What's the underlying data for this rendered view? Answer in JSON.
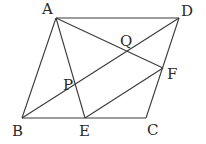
{
  "diagram": {
    "type": "geometry-figure",
    "colors": {
      "line": "#3a3a3a",
      "label": "#2a2a2a",
      "background": "#ffffff"
    },
    "points": {
      "A": {
        "label": "A",
        "x": 56,
        "y": 18,
        "label_x": 42,
        "label_y": 14
      },
      "D": {
        "label": "D",
        "x": 179,
        "y": 18,
        "label_x": 181,
        "label_y": 16
      },
      "B": {
        "label": "B",
        "x": 22,
        "y": 118,
        "label_x": 12,
        "label_y": 136
      },
      "C": {
        "label": "C",
        "x": 146,
        "y": 118,
        "label_x": 147,
        "label_y": 135
      },
      "E": {
        "label": "E",
        "x": 85,
        "y": 118,
        "label_x": 79,
        "label_y": 136
      },
      "F": {
        "label": "F",
        "x": 163,
        "y": 68,
        "label_x": 167,
        "label_y": 79
      },
      "P": {
        "label": "P",
        "x": 74,
        "y": 92,
        "label_x": 63,
        "label_y": 90
      },
      "Q": {
        "label": "Q",
        "x": 127,
        "y": 48,
        "label_x": 120,
        "label_y": 46
      }
    },
    "segments": [
      {
        "name": "AB",
        "from": "A",
        "to": "B"
      },
      {
        "name": "AD",
        "from": "A",
        "to": "D"
      },
      {
        "name": "DC",
        "from": "D",
        "to": "C"
      },
      {
        "name": "BC",
        "from": "B",
        "to": "C"
      },
      {
        "name": "BD",
        "from": "B",
        "to": "D"
      },
      {
        "name": "AE",
        "from": "A",
        "to": "E"
      },
      {
        "name": "AF",
        "from": "A",
        "to": "F"
      },
      {
        "name": "EF",
        "from": "E",
        "to": "F"
      }
    ]
  }
}
